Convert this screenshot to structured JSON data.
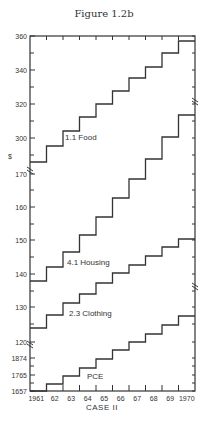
{
  "figure": {
    "title": "Figure 1.2b"
  },
  "chart_data": {
    "type": "line",
    "subtype": "step",
    "title": "Figure 1.2b",
    "xlabel": "CASE II",
    "ylabel": "$",
    "x": [
      1961,
      1962,
      1963,
      1964,
      1965,
      1966,
      1967,
      1968,
      1969,
      1970
    ],
    "x_tick_labels": [
      "1961",
      "62",
      "63",
      "64",
      "65",
      "66",
      "67",
      "68",
      "69",
      "1970"
    ],
    "y_tick_labels": [
      "360",
      "340",
      "320",
      "300",
      "170",
      "160",
      "150",
      "140",
      "130",
      "120",
      "1874",
      "1765",
      "1657"
    ],
    "axis_breaks": [
      "between 300 and 170",
      "between 120 and 1874"
    ],
    "grid": false,
    "legend": "inline labels",
    "series": [
      {
        "name": "1.1 Food",
        "label": "1.1 Food",
        "values": [
          286,
          295,
          304,
          312,
          320,
          328,
          335,
          342,
          350,
          357
        ]
      },
      {
        "name": "4.1 Housing",
        "label": "4.1 Housing",
        "values": [
          138,
          142,
          147,
          152,
          157,
          163,
          168,
          174,
          181,
          187
        ]
      },
      {
        "name": "2.3 Clothing",
        "label": "2.3 Clothing",
        "values": [
          124,
          128,
          132,
          134,
          138,
          140,
          143,
          146,
          148,
          151
        ]
      },
      {
        "name": "PCE",
        "label": "PCE",
        "values": [
          1657,
          1703,
          1756,
          1808,
          1868,
          1927,
          1980,
          2033,
          2092,
          2152
        ]
      }
    ]
  },
  "pixel_steps": {
    "food": [
      162,
      146,
      131,
      117,
      104,
      91,
      78,
      67,
      53,
      41
    ],
    "housing": [
      281,
      267,
      252,
      235,
      217,
      198,
      179,
      159,
      137,
      115
    ],
    "clothing": [
      328,
      315,
      303,
      294,
      283,
      273,
      265,
      256,
      247,
      239
    ],
    "pce": [
      391,
      384,
      376,
      368,
      359,
      350,
      342,
      334,
      325,
      316
    ]
  },
  "labels": {
    "food": "1.1 Food",
    "housing": "4.1 Housing",
    "clothing": "2.3 Clothing",
    "pce": "PCE",
    "xlabel": "CASE II",
    "ylabel": "$",
    "yticks": [
      {
        "text": "360",
        "y": 36
      },
      {
        "text": "340",
        "y": 70
      },
      {
        "text": "320",
        "y": 104
      },
      {
        "text": "300",
        "y": 138
      },
      {
        "text": "170",
        "y": 174
      },
      {
        "text": "160",
        "y": 207
      },
      {
        "text": "150",
        "y": 240
      },
      {
        "text": "140",
        "y": 274
      },
      {
        "text": "130",
        "y": 307
      },
      {
        "text": "120",
        "y": 342
      },
      {
        "text": "1874",
        "y": 358
      },
      {
        "text": "1765",
        "y": 375
      },
      {
        "text": "1657",
        "y": 391
      }
    ],
    "xticks": [
      "1961",
      "62",
      "63",
      "64",
      "65",
      "66",
      "67",
      "68",
      "69",
      "1970"
    ]
  }
}
